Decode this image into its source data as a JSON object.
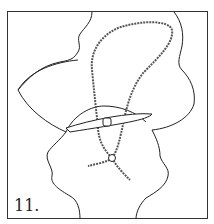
{
  "figure": {
    "label": "11."
  },
  "colors": {
    "line": "#222222",
    "cord": "#555555",
    "background": "#ffffff"
  }
}
